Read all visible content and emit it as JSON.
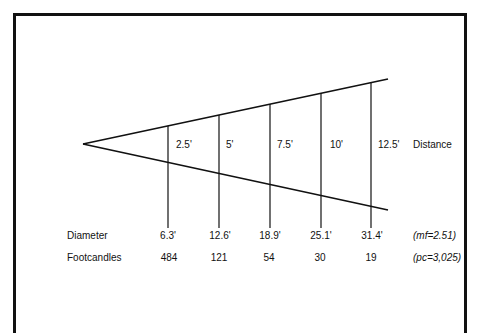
{
  "diagram": {
    "title": "",
    "distance_label": "Distance",
    "distances": [
      "2.5'",
      "5'",
      "7.5'",
      "10'",
      "12.5'"
    ],
    "rows": [
      {
        "label": "Diameter",
        "values": [
          "6.3'",
          "12.6'",
          "18.9'",
          "25.1'",
          "31.4'"
        ],
        "note": "(mf=2.51)"
      },
      {
        "label": "Footcandles",
        "values": [
          "484",
          "121",
          "54",
          "30",
          "19"
        ],
        "note": "(pc=3,025)"
      }
    ],
    "colors": {
      "line": "#111111",
      "background": "#ffffff"
    }
  }
}
